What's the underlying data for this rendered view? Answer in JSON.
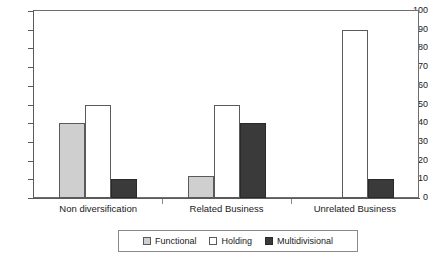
{
  "chart_data": {
    "type": "bar",
    "title": "",
    "subtitle": "",
    "xlabel": "",
    "ylabel": "",
    "categories": [
      "Non diversification",
      "Related Business",
      "Unrelated Business"
    ],
    "series": [
      {
        "name": "Functional",
        "values": [
          40,
          12,
          0
        ],
        "color": "#cfcfcf"
      },
      {
        "name": "Holding",
        "values": [
          50,
          50,
          90
        ],
        "color": "#ffffff"
      },
      {
        "name": "Multidivisional",
        "values": [
          10,
          40,
          10
        ],
        "color": "#3a3a3a"
      }
    ],
    "ylim": [
      0,
      100
    ],
    "ytick_step": 10,
    "yticks": [
      100,
      90,
      80,
      70,
      60,
      50,
      40,
      30,
      20,
      10,
      0
    ],
    "ytick_labels": [
      "100",
      "90",
      "80",
      "70",
      "60",
      "50",
      "40",
      "30",
      "20",
      "10",
      "0"
    ],
    "grid": true,
    "grid_axis": "y",
    "legend_position": "bottom",
    "bar_grouping": "grouped",
    "annotations": []
  },
  "legend": {
    "items": [
      {
        "label": "Functional"
      },
      {
        "label": "Holding"
      },
      {
        "label": "Multidivisional"
      }
    ]
  }
}
